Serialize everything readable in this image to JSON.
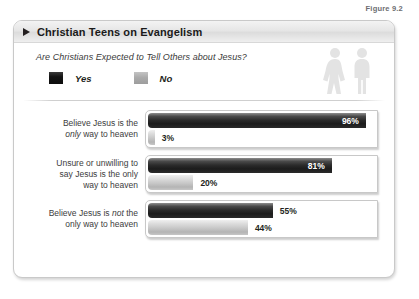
{
  "figure": {
    "caption": "Figure 9.2"
  },
  "card": {
    "title": "Christian Teens on Evangelism",
    "subtitle": "Are Christians Expected to Tell Others about Jesus?",
    "title_icon": "triangle-right-icon",
    "decoration_icon": "two-people-icon"
  },
  "legend": {
    "items": [
      {
        "label": "Yes",
        "color": "#1c1c1c"
      },
      {
        "label": "No",
        "color": "#ababab"
      }
    ]
  },
  "chart_data": {
    "type": "bar",
    "title": "Christian Teens on Evangelism",
    "subtitle": "Are Christians Expected to Tell Others about Jesus?",
    "orientation": "horizontal",
    "grouped": true,
    "xlabel": "",
    "ylabel": "",
    "xlim": [
      0,
      100
    ],
    "grid": false,
    "legend_position": "top-left",
    "categories": [
      "Believe Jesus is the only way to heaven",
      "Unsure or unwilling to say Jesus is the only way to heaven",
      "Believe Jesus is not the only way to heaven"
    ],
    "series": [
      {
        "name": "Yes",
        "color": "#1c1c1c",
        "values": [
          96,
          81,
          55
        ]
      },
      {
        "name": "No",
        "color": "#ababab",
        "values": [
          3,
          20,
          44
        ]
      }
    ],
    "rows": [
      {
        "label_html": "Believe Jesus is the<br><i>only</i> way to heaven",
        "label_text": "Believe Jesus is the only way to heaven",
        "bars": [
          {
            "series": "Yes",
            "value": 96,
            "value_label": "96%",
            "label_placement": "inside"
          },
          {
            "series": "No",
            "value": 3,
            "value_label": "3%",
            "label_placement": "outside"
          }
        ]
      },
      {
        "label_html": "Unsure or unwilling to<br>say Jesus is the only<br>way to heaven",
        "label_text": "Unsure or unwilling to say Jesus is the only way to heaven",
        "bars": [
          {
            "series": "Yes",
            "value": 81,
            "value_label": "81%",
            "label_placement": "inside"
          },
          {
            "series": "No",
            "value": 20,
            "value_label": "20%",
            "label_placement": "outside"
          }
        ]
      },
      {
        "label_html": "Believe Jesus is <i>not</i> the<br>only way to heaven",
        "label_text": "Believe Jesus is not the only way to heaven",
        "bars": [
          {
            "series": "Yes",
            "value": 55,
            "value_label": "55%",
            "label_placement": "outside"
          },
          {
            "series": "No",
            "value": 44,
            "value_label": "44%",
            "label_placement": "outside"
          }
        ]
      }
    ]
  }
}
